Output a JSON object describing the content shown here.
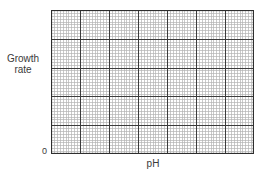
{
  "chart_data": {
    "type": "line",
    "title": "",
    "xlabel": "pH",
    "ylabel": "Growth rate",
    "y_origin_label": "0",
    "series": [],
    "grid": {
      "enabled": true,
      "major_columns": 7,
      "major_rows": 5,
      "minor_per_major": 10
    },
    "legend": null
  },
  "labels": {
    "ylabel_line1": "Growth",
    "ylabel_line2": "rate",
    "origin": "0",
    "xlabel": "pH"
  },
  "colors": {
    "minor_grid": "#b4b4b4",
    "major_grid": "#3c3c3c",
    "border": "#2e2e2e",
    "background": "#ffffff"
  }
}
